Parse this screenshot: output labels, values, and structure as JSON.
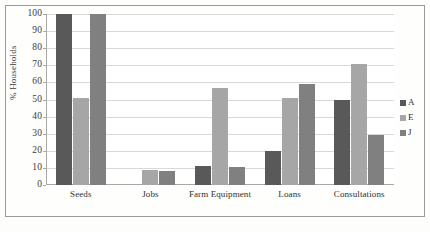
{
  "chart_data": {
    "type": "bar",
    "title": "",
    "xlabel": "",
    "ylabel": "% Households",
    "ylim": [
      0,
      100
    ],
    "ytick_step": 10,
    "grid": true,
    "legend_position": "right",
    "categories": [
      "Seeds",
      "Jobs",
      "Farm Equipment",
      "Loans",
      "Consultations"
    ],
    "series": [
      {
        "name": "A",
        "color": "#595959",
        "values": [
          100,
          0,
          11,
          20,
          50
        ]
      },
      {
        "name": "E",
        "color": "#a6a6a6",
        "values": [
          51,
          8.5,
          57,
          51,
          71
        ]
      },
      {
        "name": "J",
        "color": "#808080",
        "values": [
          100,
          8,
          10.5,
          59,
          29
        ]
      }
    ],
    "ytick_labels": [
      "100",
      "90",
      "80",
      "70",
      "60",
      "50",
      "40",
      "30",
      "20",
      "10",
      "0"
    ]
  },
  "legend": {
    "items": [
      {
        "label": "A"
      },
      {
        "label": "E"
      },
      {
        "label": "J"
      }
    ]
  }
}
